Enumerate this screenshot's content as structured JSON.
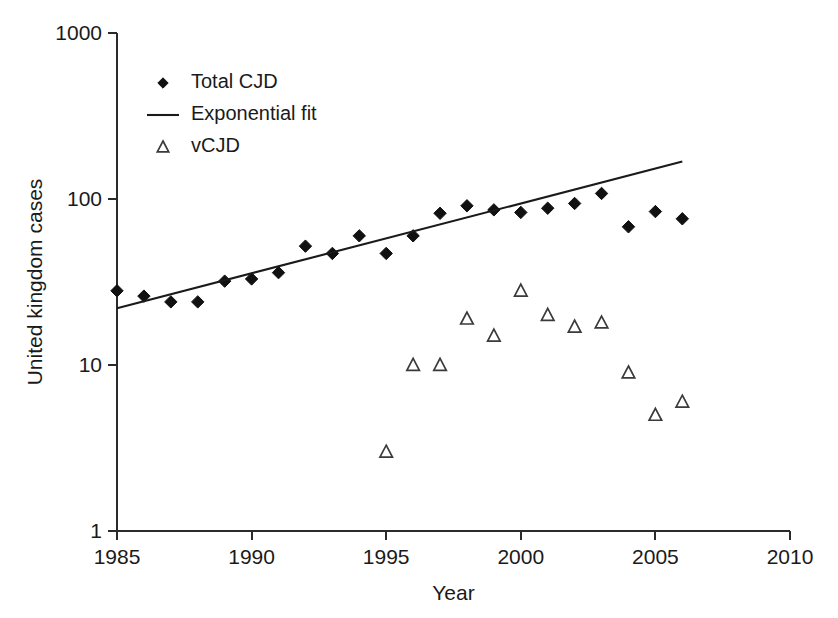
{
  "chart_data": {
    "type": "scatter",
    "title": "",
    "xlabel": "Year",
    "ylabel": "United kingdom cases",
    "xlim": [
      1985,
      2010
    ],
    "ylim": [
      1,
      1000
    ],
    "yscale": "log",
    "grid": false,
    "legend_position": "upper-left",
    "xticks": [
      "1985",
      "1990",
      "1995",
      "2000",
      "2005",
      "2010"
    ],
    "xtick_values": [
      1985,
      1990,
      1995,
      2000,
      2005,
      2010
    ],
    "yticks": [
      "1",
      "10",
      "100",
      "1000"
    ],
    "ytick_values": [
      1,
      10,
      100,
      1000
    ],
    "series": [
      {
        "name": "Total CJD",
        "marker": "diamond",
        "x": [
          1985,
          1986,
          1987,
          1988,
          1989,
          1990,
          1991,
          1992,
          1993,
          1994,
          1995,
          1996,
          1997,
          1998,
          1999,
          2000,
          2001,
          2002,
          2003,
          2004,
          2005,
          2006
        ],
        "values": [
          28,
          26,
          24,
          24,
          32,
          33,
          36,
          52,
          47,
          60,
          47,
          60,
          82,
          91,
          86,
          83,
          88,
          94,
          108,
          68,
          84,
          76
        ]
      },
      {
        "name": "Exponential fit",
        "marker": "line",
        "x": [
          1985,
          2006
        ],
        "values": [
          22,
          168
        ]
      },
      {
        "name": "vCJD",
        "marker": "triangle",
        "x": [
          1995,
          1996,
          1997,
          1998,
          1999,
          2000,
          2001,
          2002,
          2003,
          2004,
          2005,
          2006
        ],
        "values": [
          3,
          10,
          10,
          19,
          15,
          28,
          20,
          17,
          18,
          9,
          5,
          6
        ]
      }
    ],
    "legend": [
      {
        "label": "Total CJD",
        "marker": "diamond"
      },
      {
        "label": "Exponential fit",
        "marker": "line"
      },
      {
        "label": "vCJD",
        "marker": "triangle"
      }
    ]
  }
}
